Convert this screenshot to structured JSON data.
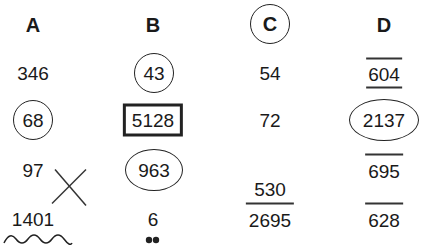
{
  "headers": [
    {
      "label": "A",
      "mark": "none"
    },
    {
      "label": "B",
      "mark": "none"
    },
    {
      "label": "C",
      "mark": "circle"
    },
    {
      "label": "D",
      "mark": "none"
    }
  ],
  "rows": [
    [
      {
        "value": "346",
        "mark": "none"
      },
      {
        "value": "43",
        "mark": "circle"
      },
      {
        "value": "54",
        "mark": "none"
      },
      {
        "value": "604",
        "mark": "overline-underline"
      }
    ],
    [
      {
        "value": "68",
        "mark": "circle"
      },
      {
        "value": "5128",
        "mark": "box"
      },
      {
        "value": "72",
        "mark": "none"
      },
      {
        "value": "2137",
        "mark": "ellipse"
      }
    ],
    [
      {
        "value": "97",
        "mark": "crossed-out"
      },
      {
        "value": "963",
        "mark": "ellipse"
      },
      {
        "value": "530",
        "mark": "crossed-out"
      },
      {
        "value": "695",
        "mark": "overline"
      }
    ],
    [
      {
        "value": "1401",
        "mark": "wavy-underline"
      },
      {
        "value": "6",
        "mark": "two-dots-below"
      },
      {
        "value": "2695",
        "mark": "overline"
      },
      {
        "value": "628",
        "mark": "overline"
      }
    ]
  ]
}
